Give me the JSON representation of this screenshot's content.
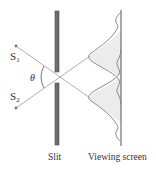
{
  "diagram": {
    "labels": {
      "source1": "S",
      "source1_sub": "1",
      "source2": "S",
      "source2_sub": "2",
      "angle": "θ",
      "slit": "Slit",
      "screen": "Viewing screen"
    },
    "colors": {
      "ray": "#9a9a9a",
      "slit": "#6e6e6e",
      "slit_edge": "#4a4a4a",
      "screen": "#555555",
      "curve": "#8a8a8a",
      "curve_fill": "#ececec",
      "source_dot": "#777777",
      "text": "#333333"
    }
  }
}
